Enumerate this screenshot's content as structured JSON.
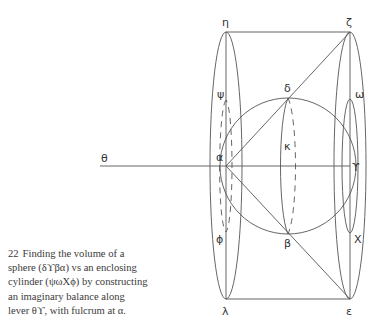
{
  "figure": {
    "number": "22",
    "caption_lines": [
      "Finding the volume of a",
      "sphere (δϒβα) vs an enclosing",
      "cylinder (ψωΧϕ) by constructing",
      "an imaginary balance along",
      "lever θϒ, with fulcrum at α."
    ],
    "labels": {
      "eta": "η",
      "zeta": "ζ",
      "psi": "ψ",
      "delta": "δ",
      "omega": "ω",
      "theta": "θ",
      "alpha": "α",
      "kappa": "κ",
      "gamma": "ϒ",
      "phi": "ϕ",
      "beta": "β",
      "chi": "Χ",
      "lambda": "λ",
      "epsilon": "ε"
    },
    "colors": {
      "line": "#555555",
      "text": "#333333"
    }
  }
}
